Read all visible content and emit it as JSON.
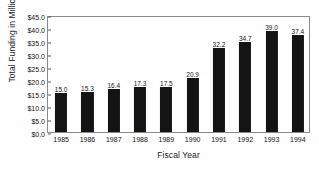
{
  "chart_data": {
    "type": "bar",
    "title": "",
    "subtitle": "",
    "xlabel": "Fiscal Year",
    "ylabel": "Total Funding in Millions",
    "categories": [
      "1985",
      "1986",
      "1987",
      "1988",
      "1989",
      "1990",
      "1991",
      "1992",
      "1993",
      "1994"
    ],
    "values": [
      15.0,
      15.3,
      16.4,
      17.3,
      17.5,
      20.9,
      32.2,
      34.7,
      39.0,
      37.4
    ],
    "data_labels": [
      "15.0",
      "15.3",
      "16.4",
      "17.3",
      "17.5",
      "20.9",
      "32.2",
      "34.7",
      "39.0",
      "37.4"
    ],
    "ylim": [
      0,
      45
    ],
    "ytick_values": [
      0,
      5,
      10,
      15,
      20,
      25,
      30,
      35,
      40,
      45
    ],
    "ytick_labels": [
      "$0.0",
      "$5.0",
      "$10.0",
      "$15.0",
      "$20.0",
      "$25.0",
      "$30.0",
      "$35.0",
      "$40.0",
      "$45.0"
    ],
    "grid": false,
    "legend": false,
    "legend_position": "none",
    "bar_color": "#141414",
    "frame_color": "#8a8a8a",
    "background_color": "#ffffff",
    "value_unit": "millions of dollars"
  }
}
